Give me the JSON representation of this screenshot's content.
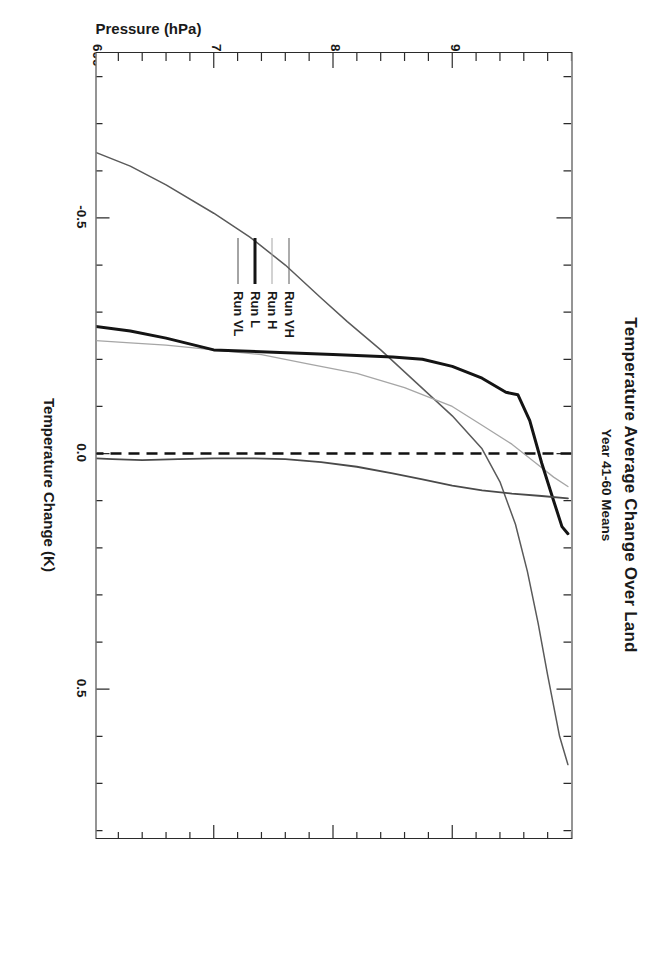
{
  "figure": {
    "title": "Temperature Average Change Over Land",
    "subtitle": "Year 41-60 Means"
  },
  "axes": {
    "pressure": {
      "label": "Pressure (hPa)",
      "ticks": [
        "900",
        "800",
        "700",
        "600"
      ],
      "tick_values": [
        900,
        800,
        700,
        600
      ],
      "range": [
        1000,
        600
      ],
      "minor_step": 20
    },
    "temperature": {
      "label": "Temperature Change (K)",
      "ticks": [
        "-0.5",
        "0.0",
        "0.5"
      ],
      "tick_values": [
        -0.5,
        0.0,
        0.5
      ],
      "range": [
        -0.85,
        0.82
      ],
      "minor_step": 0.1
    }
  },
  "legend": {
    "position": "lower-center-right",
    "entries": [
      {
        "label": "Run VH",
        "color": "#5a5a5a",
        "width": 1.5
      },
      {
        "label": "Run H",
        "color": "#a6a6a6",
        "width": 1.3
      },
      {
        "label": "Run L",
        "color": "#141414",
        "width": 3.0
      },
      {
        "label": "Run VL",
        "color": "#4a4a4a",
        "width": 1.8
      }
    ]
  },
  "reference_line": {
    "name": "zero-line",
    "value": 0.0,
    "style": "dashed",
    "color": "#111111"
  },
  "chart_data": {
    "type": "line",
    "orientation": "pressure-vertical-inverted",
    "title": "Temperature Average Change Over Land",
    "subtitle": "Year 41-60 Means",
    "xlabel": "Temperature Change (K)",
    "ylabel": "Pressure (hPa)",
    "xlim": [
      -0.85,
      0.82
    ],
    "ylim": [
      1000,
      600
    ],
    "grid": false,
    "legend_position": "lower-center-right",
    "xticks": [
      -0.5,
      0.0,
      0.5
    ],
    "yticks": [
      900,
      800,
      700,
      600
    ],
    "reference_lines": [
      {
        "axis": "x",
        "value": 0.0,
        "style": "dashed"
      }
    ],
    "series": [
      {
        "name": "Run VH",
        "color": "#5a5a5a",
        "points": [
          {
            "pressure": 997,
            "temperature": 0.66
          },
          {
            "pressure": 990,
            "temperature": 0.6
          },
          {
            "pressure": 980,
            "temperature": 0.47
          },
          {
            "pressure": 972,
            "temperature": 0.36
          },
          {
            "pressure": 963,
            "temperature": 0.25
          },
          {
            "pressure": 953,
            "temperature": 0.15
          },
          {
            "pressure": 940,
            "temperature": 0.06
          },
          {
            "pressure": 925,
            "temperature": -0.01
          },
          {
            "pressure": 900,
            "temperature": -0.08
          },
          {
            "pressure": 870,
            "temperature": -0.15
          },
          {
            "pressure": 840,
            "temperature": -0.22
          },
          {
            "pressure": 812,
            "temperature": -0.28
          },
          {
            "pressure": 790,
            "temperature": -0.33
          },
          {
            "pressure": 760,
            "temperature": -0.4
          },
          {
            "pressure": 730,
            "temperature": -0.46
          },
          {
            "pressure": 700,
            "temperature": -0.51
          },
          {
            "pressure": 660,
            "temperature": -0.57
          },
          {
            "pressure": 630,
            "temperature": -0.61
          },
          {
            "pressure": 600,
            "temperature": -0.64
          }
        ]
      },
      {
        "name": "Run H",
        "color": "#a6a6a6",
        "points": [
          {
            "pressure": 997,
            "temperature": 0.07
          },
          {
            "pressure": 985,
            "temperature": 0.05
          },
          {
            "pressure": 970,
            "temperature": 0.02
          },
          {
            "pressure": 950,
            "temperature": -0.02
          },
          {
            "pressure": 925,
            "temperature": -0.06
          },
          {
            "pressure": 900,
            "temperature": -0.1
          },
          {
            "pressure": 860,
            "temperature": -0.14
          },
          {
            "pressure": 820,
            "temperature": -0.17
          },
          {
            "pressure": 780,
            "temperature": -0.19
          },
          {
            "pressure": 740,
            "temperature": -0.21
          },
          {
            "pressure": 700,
            "temperature": -0.22
          },
          {
            "pressure": 660,
            "temperature": -0.23
          },
          {
            "pressure": 630,
            "temperature": -0.235
          },
          {
            "pressure": 600,
            "temperature": -0.24
          }
        ]
      },
      {
        "name": "Run L",
        "color": "#141414",
        "points": [
          {
            "pressure": 997,
            "temperature": 0.17
          },
          {
            "pressure": 992,
            "temperature": 0.155
          },
          {
            "pressure": 985,
            "temperature": 0.1
          },
          {
            "pressure": 975,
            "temperature": 0.02
          },
          {
            "pressure": 965,
            "temperature": -0.07
          },
          {
            "pressure": 955,
            "temperature": -0.125
          },
          {
            "pressure": 945,
            "temperature": -0.13
          },
          {
            "pressure": 925,
            "temperature": -0.16
          },
          {
            "pressure": 900,
            "temperature": -0.185
          },
          {
            "pressure": 875,
            "temperature": -0.2
          },
          {
            "pressure": 850,
            "temperature": -0.205
          },
          {
            "pressure": 800,
            "temperature": -0.21
          },
          {
            "pressure": 750,
            "temperature": -0.215
          },
          {
            "pressure": 700,
            "temperature": -0.22
          },
          {
            "pressure": 660,
            "temperature": -0.245
          },
          {
            "pressure": 630,
            "temperature": -0.26
          },
          {
            "pressure": 600,
            "temperature": -0.27
          }
        ]
      },
      {
        "name": "Run VL",
        "color": "#4a4a4a",
        "points": [
          {
            "pressure": 997,
            "temperature": 0.095
          },
          {
            "pressure": 975,
            "temperature": 0.09
          },
          {
            "pressure": 950,
            "temperature": 0.085
          },
          {
            "pressure": 925,
            "temperature": 0.078
          },
          {
            "pressure": 900,
            "temperature": 0.068
          },
          {
            "pressure": 875,
            "temperature": 0.055
          },
          {
            "pressure": 850,
            "temperature": 0.042
          },
          {
            "pressure": 820,
            "temperature": 0.028
          },
          {
            "pressure": 790,
            "temperature": 0.018
          },
          {
            "pressure": 760,
            "temperature": 0.012
          },
          {
            "pressure": 730,
            "temperature": 0.01
          },
          {
            "pressure": 700,
            "temperature": 0.01
          },
          {
            "pressure": 670,
            "temperature": 0.012
          },
          {
            "pressure": 640,
            "temperature": 0.014
          },
          {
            "pressure": 615,
            "temperature": 0.012
          },
          {
            "pressure": 600,
            "temperature": 0.01
          }
        ]
      }
    ]
  }
}
